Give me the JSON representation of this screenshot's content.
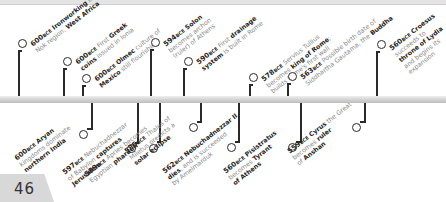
{
  "page": {
    "number": "46"
  },
  "timeline": {
    "top_events": [
      {
        "year": "600",
        "era": "BCE",
        "parts": [
          [
            "b",
            "Ironworking"
          ],
          [
            "t",
            " in"
          ],
          [
            "br"
          ],
          [
            "t",
            "Nok region, "
          ],
          [
            "b",
            "West Africa"
          ]
        ]
      },
      {
        "year": "600",
        "era": "BCE",
        "parts": [
          [
            "t",
            "First "
          ],
          [
            "b",
            "Greek"
          ],
          [
            "br"
          ],
          [
            "b",
            "coins"
          ],
          [
            "t",
            " issued in Ionia"
          ]
        ]
      },
      {
        "year": "600",
        "era": "BCE",
        "parts": [
          [
            "b",
            "Olmec"
          ],
          [
            "t",
            " culture of"
          ],
          [
            "br"
          ],
          [
            "b",
            "Mexico"
          ],
          [
            "t",
            " still flourishing"
          ]
        ]
      },
      {
        "year": "594",
        "era": "BCE",
        "parts": [
          [
            "b",
            "Solon"
          ],
          [
            "br"
          ],
          [
            "t",
            "becomes archon"
          ],
          [
            "br"
          ],
          [
            "t",
            "(ruler) of Athens"
          ]
        ]
      },
      {
        "year": "590",
        "era": "BCE",
        "parts": [
          [
            "t",
            "First "
          ],
          [
            "b",
            "drainage"
          ],
          [
            "br"
          ],
          [
            "b",
            "system"
          ],
          [
            "t",
            " is built in Rome"
          ]
        ]
      },
      {
        "year": "578",
        "era": "BCE",
        "parts": [
          [
            "t",
            "Servius Tullius"
          ],
          [
            "br"
          ],
          [
            "t",
            "becomes "
          ],
          [
            "b",
            "king of Rome"
          ],
          [
            "t",
            ";"
          ],
          [
            "br"
          ],
          [
            "t",
            "builds Rome's first wall"
          ]
        ]
      },
      {
        "year": "563",
        "era": "BCE",
        "parts": [
          [
            "t",
            "Possible birth date of"
          ],
          [
            "br"
          ],
          [
            "t",
            "Siddhartha Gautama, the "
          ],
          [
            "b",
            "Buddha"
          ]
        ]
      },
      {
        "year": "560",
        "era": "BCE",
        "parts": [
          [
            "b",
            "Croesus"
          ],
          [
            "br"
          ],
          [
            "t",
            "succeeds to"
          ],
          [
            "br"
          ],
          [
            "b",
            "throne of Lydia"
          ],
          [
            "br"
          ],
          [
            "t",
            "and begins its"
          ],
          [
            "br"
          ],
          [
            "t",
            "expansion"
          ]
        ]
      }
    ],
    "bottom_events": [
      {
        "year": "600",
        "era": "BCE",
        "parts": [
          [
            "b",
            "Aryan"
          ],
          [
            "br"
          ],
          [
            "t",
            "kingdoms dominate"
          ],
          [
            "br"
          ],
          [
            "b",
            "northern India"
          ]
        ]
      },
      {
        "year": "597",
        "era": "BCE",
        "parts": [
          [
            "t",
            "Nebuchadnezzar"
          ],
          [
            "br"
          ],
          [
            "t",
            "of Babylon "
          ],
          [
            "b",
            "captures"
          ],
          [
            "br"
          ],
          [
            "b",
            "Jerusalem"
          ]
        ]
      },
      {
        "year": "589",
        "era": "BCE",
        "parts": [
          [
            "t",
            "Apries becomes"
          ],
          [
            "br"
          ],
          [
            "t",
            "Egyptian "
          ],
          [
            "b",
            "pharaoh"
          ]
        ]
      },
      {
        "year": "585",
        "era": "BCE",
        "parts": [
          [
            "t",
            "Thales of"
          ],
          [
            "br"
          ],
          [
            "t",
            "Miletus predicts a"
          ],
          [
            "br"
          ],
          [
            "b",
            "solar eclipse"
          ]
        ]
      },
      {
        "year": "562",
        "era": "BCE",
        "parts": [
          [
            "b",
            "Nebuchadnezzar II"
          ],
          [
            "br"
          ],
          [
            "b",
            "dies"
          ],
          [
            "t",
            ", and is succeeded"
          ],
          [
            "br"
          ],
          [
            "t",
            "by Amelmarduk"
          ]
        ]
      },
      {
        "year": "560",
        "era": "BCE",
        "parts": [
          [
            "b",
            "Pisistratus"
          ],
          [
            "br"
          ],
          [
            "t",
            "becomes "
          ],
          [
            "b",
            "Tyrant"
          ],
          [
            "br"
          ],
          [
            "b",
            "of Athens"
          ]
        ]
      },
      {
        "year": "559",
        "era": "BCE",
        "parts": [
          [
            "b",
            "Cyrus"
          ],
          [
            "t",
            " the Great"
          ],
          [
            "br"
          ],
          [
            "t",
            "becomes "
          ],
          [
            "b",
            "ruler"
          ],
          [
            "br"
          ],
          [
            "t",
            "of "
          ],
          [
            "b",
            "Anshan"
          ]
        ]
      }
    ]
  },
  "colors": {
    "text_dark": "#262626",
    "text_gray": "#8a8a8a",
    "line": "#2a2a2a",
    "bar": "#cfcfcf",
    "page_tab": "#d8d8d8"
  }
}
